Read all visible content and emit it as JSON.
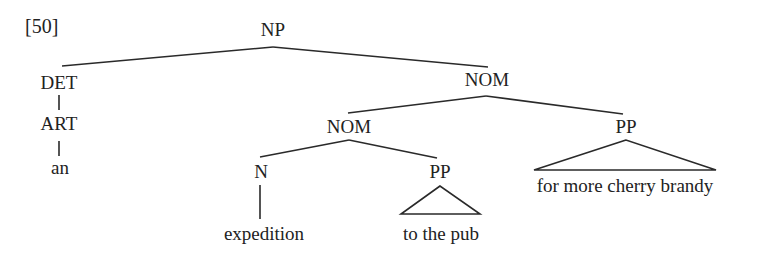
{
  "example_number": "[50]",
  "tree": {
    "root": "NP",
    "nodes": {
      "np": "NP",
      "det": "DET",
      "art": "ART",
      "an": "an",
      "nom_top": "NOM",
      "nom_inner": "NOM",
      "pp_right": "PP",
      "pp_right_leaf": "for more cherry brandy",
      "n": "N",
      "expedition": "expedition",
      "pp_inner": "PP",
      "pp_inner_leaf": "to the pub"
    },
    "structure": "[NP [DET [ART an]] [NOM [NOM [N expedition] [PP to the pub]] [PP for more cherry brandy]]]",
    "line_color": "#2a2a2a",
    "text_color": "#222222"
  }
}
